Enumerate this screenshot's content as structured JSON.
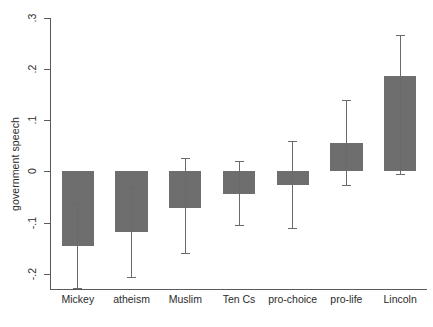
{
  "chart_data": {
    "type": "bar",
    "title": "",
    "subtitle": "",
    "xlabel": "",
    "ylabel": "government speech",
    "categories": [
      "Mickey",
      "atheism",
      "Muslim",
      "Ten Cs",
      "pro-choice",
      "pro-life",
      "Lincoln"
    ],
    "values": [
      -0.145,
      -0.118,
      -0.071,
      -0.045,
      -0.026,
      0.056,
      0.187
    ],
    "errors_low": [
      -0.228,
      -0.207,
      -0.16,
      -0.105,
      -0.11,
      -0.026,
      -0.006
    ],
    "errors_high": [
      -0.062,
      -0.03,
      0.026,
      0.021,
      0.06,
      0.139,
      0.266
    ],
    "ylim": [
      -0.23,
      0.3
    ],
    "yticks": [
      0.3,
      0.2,
      0.1,
      0,
      -0.1,
      -0.2
    ],
    "ytick_labels": [
      ".3",
      ".2",
      ".1",
      "0",
      "-.1",
      "-.2"
    ],
    "grid": false,
    "legend": "none",
    "bar_color": "#6e6e6e",
    "error_color": "#6a6a6a",
    "axis_color": "#5a5a5a",
    "background": "#ffffff",
    "error_bar_note": "vertical whiskers with horizontal caps denote confidence intervals"
  }
}
